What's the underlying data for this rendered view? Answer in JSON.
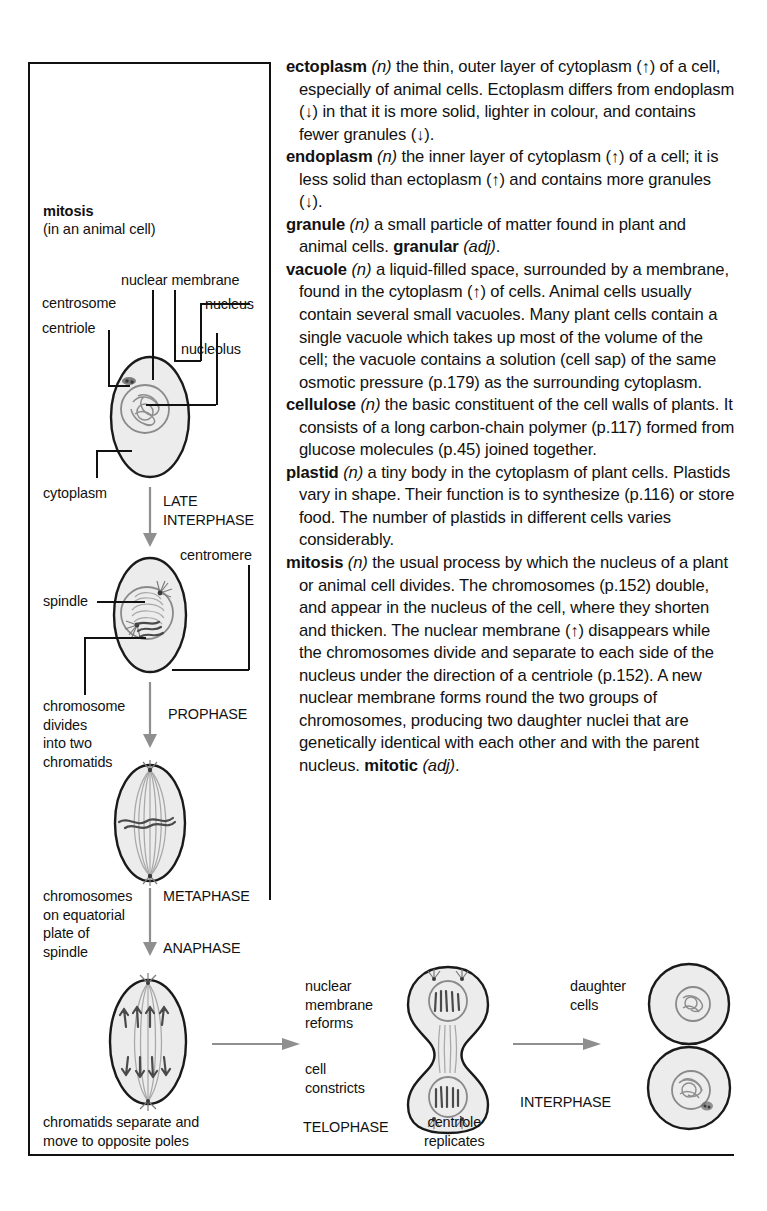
{
  "definitions": [
    {
      "headword": "ectoplasm",
      "pos": "(n)",
      "text": " the thin, outer layer of cytoplasm (↑) of a cell, especially of animal cells. Ectoplasm differs from endoplasm (↓) in that it is more solid, lighter in colour, and contains fewer granules (↓)."
    },
    {
      "headword": "endoplasm",
      "pos": "(n)",
      "text": " the inner layer of cytoplasm (↑) of a cell; it is less solid than ectoplasm (↑) and contains more granules (↓)."
    },
    {
      "headword": "granule",
      "pos": "(n)",
      "text": " a small particle of matter found in plant and animal cells. ",
      "derived": "granular",
      "derived_pos": "(adj)",
      "tail": "."
    },
    {
      "headword": "vacuole",
      "pos": "(n)",
      "text": " a liquid-filled space, surrounded by a membrane, found in the cytoplasm (↑) of cells. Animal cells usually contain several small vacuoles. Many plant cells contain a single vacuole which takes up most of the volume of the cell; the vacuole contains a solution (cell sap) of the same osmotic pressure (p.179) as the surrounding cytoplasm."
    },
    {
      "headword": "cellulose",
      "pos": "(n)",
      "text": " the basic constituent of the cell walls of plants. It consists of a long carbon-chain polymer (p.117) formed from glucose molecules (p.45) joined together."
    },
    {
      "headword": "plastid",
      "pos": "(n)",
      "text": " a tiny body in the cytoplasm of plant cells. Plastids vary in shape. Their function is to synthesize (p.116) or store food. The number of plastids in different cells varies considerably."
    },
    {
      "headword": "mitosis",
      "pos": "(n)",
      "text": " the usual process by which the nucleus of a plant or animal cell divides. The chromosomes (p.152) double, and appear in the nucleus of the cell, where they shorten and thicken. The nuclear membrane (↑) disappears while the chromosomes divide and separate to each side of the nucleus under the direction of a centriole (p.152). A new nuclear membrane forms round the two groups of chromosomes, producing two daughter nuclei that are genetically identical with each other and with the parent nucleus. ",
      "derived": "mitotic",
      "derived_pos": "(adj)",
      "tail": "."
    }
  ],
  "diagram": {
    "title": "mitosis",
    "subtitle": "(in an animal cell)",
    "labels": {
      "nuclear_membrane": "nuclear membrane",
      "centrosome": "centrosome",
      "centriole": "centriole",
      "nucleus": "nucleus",
      "nucleolus": "nucleolus",
      "cytoplasm": "cytoplasm",
      "centromere": "centromere",
      "spindle": "spindle",
      "chromosome_divides": "chromosome\ndivides\ninto two\nchromatids",
      "chromosomes_equatorial": "chromosomes\non equatorial\nplate of\nspindle",
      "chromatids_separate": "chromatids separate and\nmove to opposite poles",
      "nuclear_membrane_reforms": "nuclear\nmembrane\nreforms",
      "cell_constricts": "cell\nconstricts",
      "centriole_replicates": "centriole\nreplicates",
      "daughter_cells": "daughter\ncells"
    },
    "phases": {
      "late_interphase": "LATE\nINTERPHASE",
      "prophase": "PROPHASE",
      "metaphase": "METAPHASE",
      "anaphase": "ANAPHASE",
      "telophase": "TELOPHASE",
      "interphase": "INTERPHASE"
    }
  }
}
